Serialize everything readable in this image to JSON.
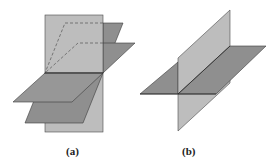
{
  "figure": {
    "panels": [
      {
        "id": "a",
        "caption": "(a)",
        "description": "Three planes intersecting in a common line: one vertical plane and two tilted planes"
      },
      {
        "id": "b",
        "caption": "(b)",
        "description": "Two planes intersecting in a line: one vertical plane and one horizontal plane"
      }
    ],
    "colors": {
      "vertical_plane": "#bdbdbd",
      "tilted_plane": "#8f8f8f",
      "edge": "#3a3a3a",
      "hidden_edge": "#555555",
      "background": "#ffffff"
    }
  }
}
